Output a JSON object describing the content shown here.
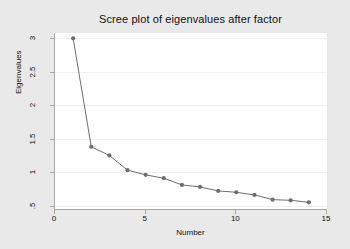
{
  "chart_data": {
    "type": "line",
    "title": "Scree plot of eigenvalues after factor",
    "xlabel": "Number",
    "ylabel": "Eigenvalues",
    "x": [
      1,
      2,
      3,
      4,
      5,
      6,
      7,
      8,
      9,
      10,
      11,
      12,
      13,
      14
    ],
    "values": [
      3.0,
      1.38,
      1.25,
      1.03,
      0.96,
      0.91,
      0.81,
      0.78,
      0.72,
      0.7,
      0.66,
      0.59,
      0.58,
      0.55
    ],
    "series": [
      {
        "name": "Eigenvalues",
        "values": [
          3.0,
          1.38,
          1.25,
          1.03,
          0.96,
          0.91,
          0.81,
          0.78,
          0.72,
          0.7,
          0.66,
          0.59,
          0.58,
          0.55
        ]
      }
    ],
    "xlim": [
      0,
      15
    ],
    "ylim": [
      0.45,
      3.08
    ],
    "xticks": [
      0,
      5,
      10,
      15
    ],
    "xtick_labels": [
      "0",
      "5",
      "10",
      "15"
    ],
    "yticks": [
      0.5,
      1,
      1.5,
      2,
      2.5,
      3
    ],
    "ytick_labels": [
      ".5",
      "1",
      "1.5",
      "2",
      "2.5",
      "3"
    ],
    "grid": "horizontal",
    "legend": "none",
    "marker": "circle",
    "colors": {
      "line": "#6e6e6e",
      "marker": "#6e6e6e",
      "gridline": "#f0f0f0",
      "axis": "#a8a8a8",
      "plot_background": "#ffffff",
      "graph_background": "#e9e9e9",
      "text": "#101010"
    }
  }
}
